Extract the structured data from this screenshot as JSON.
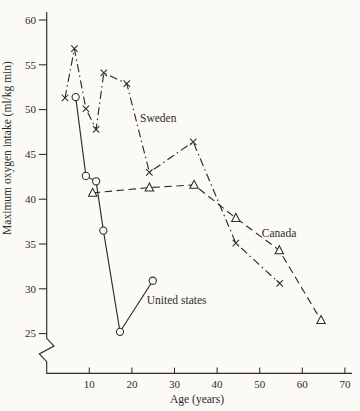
{
  "figure": {
    "ink": "#2e2b27",
    "background": "#fbfaf6"
  },
  "chart_data": {
    "type": "line",
    "title": "",
    "xlabel": "Age (years)",
    "ylabel": "Maximum oxygen intake (ml/kg min)",
    "x_ticks": [
      10,
      20,
      30,
      40,
      50,
      60,
      70
    ],
    "y_ticks": [
      60,
      55,
      50,
      45,
      40,
      35,
      30,
      25
    ],
    "xlim": [
      0,
      72
    ],
    "ylim_shown": [
      25,
      60
    ],
    "y_axis_break": true,
    "grid": false,
    "legend": "inline-annotations",
    "series": [
      {
        "name": "Sweden",
        "marker": "x",
        "line_style": "dash-dot",
        "points": [
          [
            4.3,
            51.3
          ],
          [
            6.5,
            56.8
          ],
          [
            9.2,
            50.1
          ],
          [
            11.6,
            47.8
          ],
          [
            13.4,
            54.1
          ],
          [
            18.8,
            52.9
          ],
          [
            24.1,
            43.0
          ],
          [
            34.4,
            46.4
          ],
          [
            44.4,
            35.1
          ],
          [
            54.7,
            30.6
          ]
        ],
        "label": {
          "text": "Sweden",
          "x": 21.9,
          "y": 48.6
        }
      },
      {
        "name": "Canada",
        "marker": "triangle",
        "line_style": "dashed",
        "points": [
          [
            10.8,
            40.7
          ],
          [
            24.1,
            41.3
          ],
          [
            34.6,
            41.6
          ],
          [
            44.4,
            37.9
          ],
          [
            54.6,
            34.3
          ],
          [
            64.4,
            26.5
          ]
        ],
        "label": {
          "text": "Canada",
          "x": 50.5,
          "y": 35.8
        }
      },
      {
        "name": "United states",
        "marker": "circle",
        "line_style": "solid",
        "points": [
          [
            6.8,
            51.4
          ],
          [
            9.2,
            42.6
          ],
          [
            11.6,
            42.0
          ],
          [
            13.3,
            36.5
          ],
          [
            17.2,
            25.2
          ],
          [
            24.9,
            30.9
          ]
        ],
        "label": {
          "text": "United states",
          "x": 23.5,
          "y": 28.3
        }
      }
    ]
  }
}
